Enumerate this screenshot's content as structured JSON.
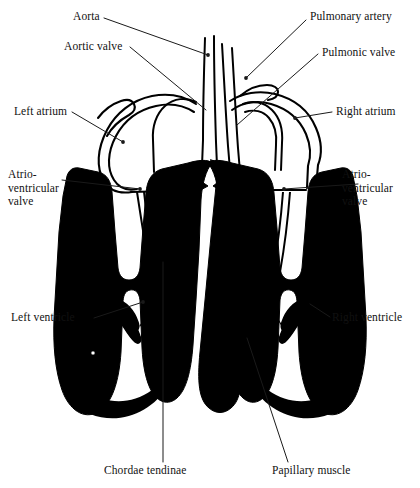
{
  "figure": {
    "background_color": "#ffffff",
    "ink_color": "#000000",
    "width": 420,
    "height": 488
  },
  "labels": {
    "aorta": "Aorta",
    "aortic_valve": "Aortic valve",
    "left_atrium": "Left atrium",
    "av_valve_left_line1": "Atrio-",
    "av_valve_left_line2": "ventricular",
    "av_valve_left_line3": "valve",
    "left_ventricle": "Left ventricle",
    "pulmonary_artery": "Pulmonary artery",
    "pulmonic_valve": "Pulmonic valve",
    "right_atrium": "Right atrium",
    "av_valve_right_line1": "Atrio-",
    "av_valve_right_line2": "ventricular",
    "av_valve_right_line3": "valve",
    "right_ventricle": "Right ventricle",
    "chordae_tendinae": "Chordae tendinae",
    "papillary_muscle": "Papillary muscle"
  },
  "structures": [
    {
      "name": "aorta",
      "side": "center-left",
      "type": "great-vessel"
    },
    {
      "name": "aortic-valve",
      "side": "center-left",
      "type": "valve"
    },
    {
      "name": "left-atrium",
      "side": "left",
      "type": "chamber"
    },
    {
      "name": "atrioventricular-valve-left",
      "side": "left",
      "type": "valve"
    },
    {
      "name": "left-ventricle",
      "side": "left",
      "type": "chamber"
    },
    {
      "name": "pulmonary-artery",
      "side": "center-right",
      "type": "great-vessel"
    },
    {
      "name": "pulmonic-valve",
      "side": "center-right",
      "type": "valve"
    },
    {
      "name": "right-atrium",
      "side": "right",
      "type": "chamber"
    },
    {
      "name": "atrioventricular-valve-right",
      "side": "right",
      "type": "valve"
    },
    {
      "name": "right-ventricle",
      "side": "right",
      "type": "chamber"
    },
    {
      "name": "chordae-tendinae",
      "side": "both",
      "type": "fibrous-cord"
    },
    {
      "name": "papillary-muscle",
      "side": "both",
      "type": "muscle"
    },
    {
      "name": "interventricular-septum",
      "side": "center",
      "type": "muscle"
    },
    {
      "name": "myocardium",
      "side": "both",
      "type": "muscle"
    }
  ]
}
